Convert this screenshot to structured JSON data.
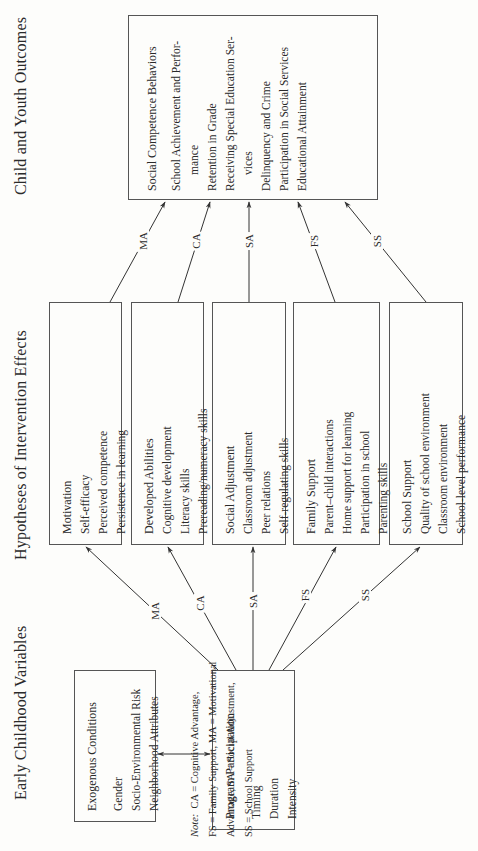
{
  "columns": {
    "left_title": "Early Childhood Variables",
    "middle_title": "Hypotheses of Intervention Effects",
    "right_title": "Child and Youth Outcomes"
  },
  "left_boxes": {
    "exogenous": {
      "heading": "Exogenous Conditions",
      "items": [
        "Gender",
        "Socio-Environmental Risk",
        "Neighborhood Attributes"
      ]
    },
    "program": {
      "heading": "Program Participation",
      "items": [
        "Timing",
        "Duration",
        "Intensity"
      ]
    }
  },
  "middle_boxes": [
    {
      "heading": "Motivation",
      "items": [
        "Self-efficacy",
        "Perceived competence",
        "Persistence in learning"
      ],
      "path_label": "MA"
    },
    {
      "heading": "Developed Abilities",
      "items": [
        "Cognitive development",
        "Literacy skills",
        "Prereading/numeracy skills"
      ],
      "path_label": "CA"
    },
    {
      "heading": "Social Adjustment",
      "items": [
        "Classroom adjustment",
        "Peer relations",
        "Self-regulating skills"
      ],
      "path_label": "SA"
    },
    {
      "heading": "Family Support",
      "items": [
        "Parent–child interactions",
        "Home support for learning",
        "Participation in school",
        "Parenting skills"
      ],
      "path_label": "FS"
    },
    {
      "heading": "School Support",
      "items": [
        "Quality of school environment",
        "Classroom environment",
        "School-level performance"
      ],
      "path_label": "SS"
    }
  ],
  "outcome_box": {
    "heading": "Social Competence Behaviors",
    "items": [
      {
        "text": "School Achievement and Perfor-",
        "indent": false
      },
      {
        "text": "mance",
        "indent": true
      },
      {
        "text": "Retention in Grade",
        "indent": false
      },
      {
        "text": "Receiving Special Education Ser-",
        "indent": false
      },
      {
        "text": "vices",
        "indent": true
      },
      {
        "text": "Delinquency and Crime",
        "indent": false
      },
      {
        "text": "Participation in Social Services",
        "indent": false
      },
      {
        "text": "Educational Attainment",
        "indent": false
      }
    ]
  },
  "note": {
    "prefix": "Note:",
    "lines": [
      "CA = Cognitive Advantage,",
      "FS = Family Support, MA = Motivational",
      "Advantage, SA = Social Adjustment,",
      "SS = School Support"
    ]
  }
}
